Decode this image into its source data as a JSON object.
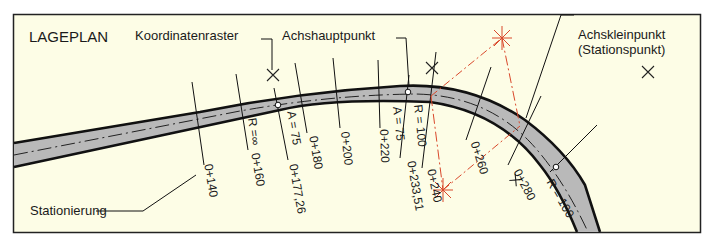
{
  "figure": {
    "title": "LAGEPLAN",
    "background": "#fdfde6",
    "frame_color": "#222222",
    "road_fill": "#b9b9b9",
    "construction_color": "#d9482b"
  },
  "callouts": {
    "koordinatenraster": "Koordinatenraster",
    "achshauptpunkt": "Achshauptpunkt",
    "achskleinpunkt_1": "Achskleinpunkt",
    "achskleinpunkt_2": "(Stationspunkt)",
    "stationierung": "Stationierung"
  },
  "stations": [
    {
      "label": "0+140"
    },
    {
      "label": "0+160"
    },
    {
      "label": "0+177,26"
    },
    {
      "label": "0+180"
    },
    {
      "label": "0+200"
    },
    {
      "label": "0+220"
    },
    {
      "label": "0+233,51"
    },
    {
      "label": "0+240"
    },
    {
      "label": "0+260"
    },
    {
      "label": "0+280"
    }
  ],
  "parameters": {
    "r_infinite": "R =∞",
    "a_75_first": "A = 75",
    "a_75_second": "A = 75",
    "r_100_first": "R = 100",
    "r_100_second": "R = 100"
  }
}
